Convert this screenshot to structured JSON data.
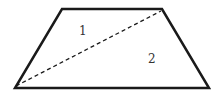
{
  "diagram": {
    "shape": "trapezoid",
    "vertices": {
      "top_left": [
        62,
        9
      ],
      "top_right": [
        162,
        9
      ],
      "bottom_right": [
        209,
        88
      ],
      "bottom_left": [
        15,
        88
      ]
    },
    "diagonal": {
      "from": "bottom_left",
      "to": "top_right",
      "style": "dashed"
    },
    "regions": [
      {
        "label": "1",
        "x": 79,
        "y": 35
      },
      {
        "label": "2",
        "x": 148,
        "y": 63
      }
    ],
    "colors": {
      "stroke": "#1a1a1a",
      "label": "#333333",
      "background": "#ffffff"
    }
  }
}
